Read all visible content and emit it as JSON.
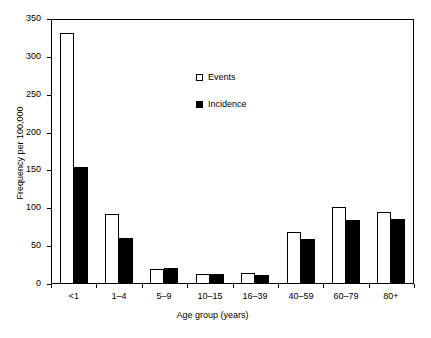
{
  "chart_data": {
    "type": "bar",
    "title": "",
    "xlabel": "Age group (years)",
    "ylabel": "Frequency per 100,000",
    "categories": [
      "<1",
      "1–4",
      "5–9",
      "10–15",
      "16–39",
      "40–59",
      "60–79",
      "80+"
    ],
    "series": [
      {
        "name": "Events",
        "color": "#ffffff",
        "values": [
          332,
          92,
          20,
          13,
          14,
          69,
          102,
          95
        ]
      },
      {
        "name": "Incidence",
        "color": "#000000",
        "values": [
          154,
          61,
          21,
          13,
          12,
          59,
          84,
          86
        ]
      }
    ],
    "ylim": [
      0,
      350
    ],
    "yticks": [
      0,
      50,
      100,
      150,
      200,
      250,
      300,
      350
    ],
    "ytick_labels": [
      "0",
      "50",
      "100",
      "150",
      "200",
      "250",
      "300",
      "350"
    ],
    "grid": false,
    "legend_position": "upper center",
    "frame": "box"
  },
  "legend": {
    "entries": [
      {
        "label": "Events",
        "swatch": "open-square"
      },
      {
        "label": "Incidence",
        "swatch": "filled-square"
      }
    ]
  }
}
